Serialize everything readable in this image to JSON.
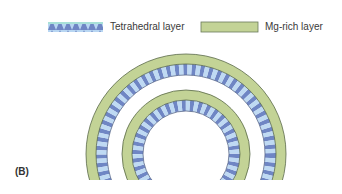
{
  "legend": {
    "items": [
      {
        "label": "Tetrahedral layer",
        "icon": "triangle-band-swatch",
        "color_light": "#b8d6f2",
        "color_dark": "#6f86c4"
      },
      {
        "label": "Mg-rich layer",
        "icon": "solid-band-swatch",
        "color": "#c3d396"
      }
    ]
  },
  "panel_label": "(B)",
  "colors": {
    "mg_layer": "#c3d396",
    "tetra_light": "#b8d6f2",
    "tetra_dark": "#6f86c4",
    "outline": "#5a6a4a"
  }
}
